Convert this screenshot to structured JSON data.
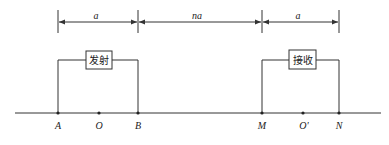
{
  "diagram": {
    "dimensions": [
      {
        "label": "a",
        "from": "A",
        "to": "B"
      },
      {
        "label": "na",
        "from": "B",
        "to": "M"
      },
      {
        "label": "a",
        "from": "M",
        "to": "N"
      }
    ],
    "transmitter": {
      "label": "发射",
      "from": "A",
      "to": "B"
    },
    "receiver": {
      "label": "接收",
      "from": "M",
      "to": "N"
    },
    "points": [
      {
        "name": "A"
      },
      {
        "name": "O"
      },
      {
        "name": "B"
      },
      {
        "name": "M"
      },
      {
        "name": "O'"
      },
      {
        "name": "N"
      }
    ]
  },
  "colors": {
    "line": "#333333",
    "background": "#ffffff"
  }
}
